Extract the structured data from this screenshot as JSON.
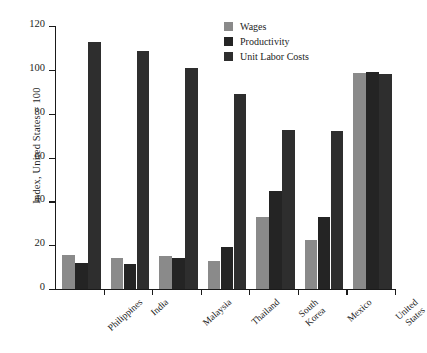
{
  "chart_data": {
    "type": "bar",
    "title": "",
    "xlabel": "",
    "ylabel": "Index, United States = 100",
    "ylim": [
      0,
      120
    ],
    "yticks": [
      0,
      20,
      40,
      60,
      80,
      100,
      120
    ],
    "grid": false,
    "legend_position": "top-right",
    "categories": [
      "Philippines",
      "India",
      "Malaysia",
      "Thailand",
      "South\nKorea",
      "Mexico",
      "United\nStates"
    ],
    "series": [
      {
        "name": "Wages",
        "color": "#8a8a8a",
        "values": [
          15.5,
          14,
          15,
          13,
          33,
          22.5,
          98.5
        ]
      },
      {
        "name": "Productivity",
        "color": "#242424",
        "values": [
          12,
          11.5,
          14,
          19,
          44.5,
          33,
          99
        ]
      },
      {
        "name": "Unit Labor Costs",
        "color": "#2e2e2e",
        "values": [
          112.5,
          108.5,
          101,
          89,
          72.5,
          72,
          98
        ]
      }
    ]
  },
  "legend": {
    "items": [
      {
        "label": "Wages",
        "swatch": "wages"
      },
      {
        "label": "Productivity",
        "swatch": "productivity"
      },
      {
        "label": "Unit Labor Costs",
        "swatch": "ulc"
      }
    ]
  }
}
